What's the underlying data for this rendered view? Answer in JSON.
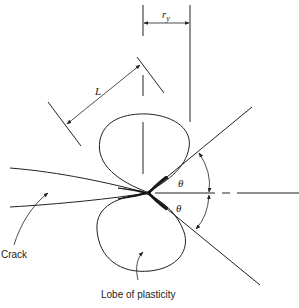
{
  "diagram": {
    "labels": {
      "ry_main": "r",
      "ry_sub": "y",
      "length": "L",
      "theta_upper": "θ",
      "theta_lower": "θ",
      "crack": "Crack",
      "lobe": "Lobe of plasticity"
    },
    "colors": {
      "line": "#222222",
      "background": "#ffffff"
    }
  }
}
